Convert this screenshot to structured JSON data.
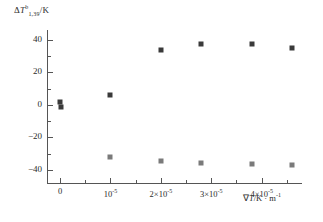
{
  "chart_data": {
    "type": "scatter",
    "title": "",
    "ylabel": "ΔT b1,39/K",
    "ylabel_parts": {
      "delta": "Δ",
      "symbol": "T",
      "sup": "b",
      "sub": "1,39",
      "unit": "/K"
    },
    "xlabel": "∇T/K · m⁻¹",
    "xlabel_parts": {
      "nabla": "∇",
      "symbol": "T",
      "unit": "/K · m",
      "exp": "-1"
    },
    "xlim": [
      -2.5e-06,
      4.8e-05
    ],
    "ylim": [
      -48,
      46
    ],
    "grid": false,
    "legend": "none",
    "x_ticks": [
      {
        "value": 0,
        "label": "0",
        "mantissa": "0",
        "exponent": ""
      },
      {
        "value": 1e-05,
        "label": "10⁻⁵",
        "mantissa": "10",
        "exponent": "-5"
      },
      {
        "value": 2e-05,
        "label": "2×10⁻⁵",
        "mantissa": "2×10",
        "exponent": "-5"
      },
      {
        "value": 3e-05,
        "label": "3×10⁻⁵",
        "mantissa": "3×10",
        "exponent": "-5"
      },
      {
        "value": 4e-05,
        "label": "4×10⁻⁵",
        "mantissa": "4×10",
        "exponent": "-5"
      }
    ],
    "y_ticks": [
      {
        "value": 40,
        "label": "40"
      },
      {
        "value": 20,
        "label": "20"
      },
      {
        "value": 0,
        "label": "0"
      },
      {
        "value": -20,
        "label": "−20"
      },
      {
        "value": -40,
        "label": "−40"
      }
    ],
    "y_minor_ticks": [
      30,
      10,
      -10,
      -30
    ],
    "series": [
      {
        "name": "upper",
        "color": "#3a3a3a",
        "marker": "square",
        "points": [
          {
            "x": 0.0,
            "y": 1.5
          },
          {
            "x": 2e-07,
            "y": -1.0
          },
          {
            "x": 1e-05,
            "y": 6.0
          },
          {
            "x": 2e-05,
            "y": 34.0
          },
          {
            "x": 2.8e-05,
            "y": 37.5
          },
          {
            "x": 3.8e-05,
            "y": 37.5
          },
          {
            "x": 4.6e-05,
            "y": 35.0
          }
        ]
      },
      {
        "name": "lower",
        "color": "#7a7a7a",
        "marker": "square",
        "points": [
          {
            "x": 1e-05,
            "y": -32.0
          },
          {
            "x": 2e-05,
            "y": -34.5
          },
          {
            "x": 2.8e-05,
            "y": -36.0
          },
          {
            "x": 3.8e-05,
            "y": -36.5
          },
          {
            "x": 4.6e-05,
            "y": -37.0
          }
        ]
      }
    ]
  }
}
